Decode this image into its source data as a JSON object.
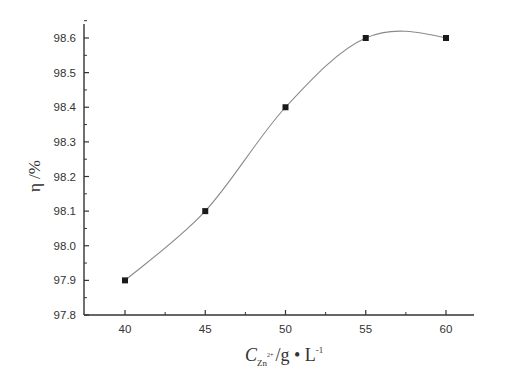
{
  "chart_data": {
    "type": "line",
    "title": "",
    "xlabel": "C_Zn2+ /g • L-1",
    "ylabel": "η /%",
    "x": [
      40,
      45,
      50,
      55,
      60
    ],
    "series": [
      {
        "name": "η",
        "values": [
          97.9,
          98.1,
          98.4,
          98.6,
          98.6
        ],
        "marker": "square",
        "line": "smooth spline"
      }
    ],
    "xlim": [
      37.5,
      62.5
    ],
    "ylim": [
      97.8,
      98.65
    ],
    "xticks": [
      "40",
      "45",
      "50",
      "55",
      "60"
    ],
    "yticks": [
      "97.8",
      "97.9",
      "98.0",
      "98.1",
      "98.2",
      "98.3",
      "98.4",
      "98.5",
      "98.6"
    ],
    "grid": false,
    "legend": "none"
  },
  "axes": {
    "x_title_main": "C",
    "x_title_sub": "Zn",
    "x_title_sup": "2+",
    "x_title_unit": "/g • L",
    "x_title_unit_sup": "-1",
    "y_title": "η /%"
  },
  "colors": {
    "axis": "#333333",
    "line": "#8a8a8a",
    "marker": "#1a1a1a"
  }
}
